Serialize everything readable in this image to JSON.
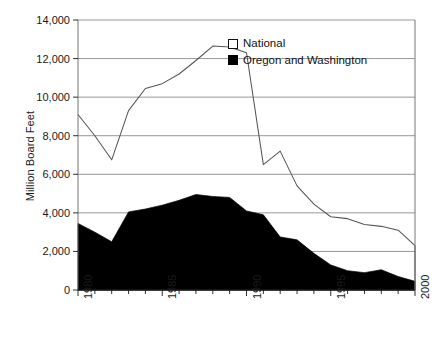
{
  "chart_data": {
    "type": "area",
    "title": "",
    "xlabel": "",
    "ylabel": "Million Board Feet",
    "xlim": [
      1980,
      2000
    ],
    "ylim": [
      0,
      14000
    ],
    "grid": true,
    "legend_position": "top-right-inside",
    "x": [
      1980,
      1981,
      1982,
      1983,
      1984,
      1985,
      1986,
      1987,
      1988,
      1989,
      1990,
      1991,
      1992,
      1993,
      1994,
      1995,
      1996,
      1997,
      1998,
      1999,
      2000
    ],
    "xtick_labels": [
      "1980",
      "1985",
      "1990",
      "1995",
      "2000"
    ],
    "xtick_values": [
      1980,
      1985,
      1990,
      1995,
      2000
    ],
    "ytick_labels": [
      "0",
      "2,000",
      "4,000",
      "6,000",
      "8,000",
      "10,000",
      "12,000",
      "14,000"
    ],
    "ytick_values": [
      0,
      2000,
      4000,
      6000,
      8000,
      10000,
      12000,
      14000
    ],
    "series": [
      {
        "name": "National",
        "style": "line",
        "color": "#555555",
        "fill": "none",
        "values": [
          9100,
          8000,
          6750,
          9300,
          10450,
          10700,
          11200,
          11900,
          12650,
          12600,
          12300,
          6500,
          7200,
          5400,
          4450,
          3800,
          3700,
          3400,
          3300,
          3100,
          2300
        ]
      },
      {
        "name": "Oregon and Washington",
        "style": "filled-area",
        "color": "#000000",
        "fill": "#000000",
        "values": [
          3450,
          3000,
          2500,
          4050,
          4200,
          4400,
          4650,
          4950,
          4850,
          4800,
          4100,
          3900,
          2750,
          2600,
          1900,
          1300,
          1000,
          900,
          1050,
          700,
          450
        ]
      }
    ]
  },
  "legend": {
    "items": [
      {
        "label": "National",
        "swatch": "open-square"
      },
      {
        "label": "Oregon and Washington",
        "swatch": "filled-square"
      }
    ]
  },
  "axes": {
    "y_title": "Million Board Feet"
  },
  "colors": {
    "national_line": "#555555",
    "oregon_washington_fill": "#000000",
    "gridline": "#8c8c8c",
    "axis": "#666666",
    "text": "#1a1a1a",
    "background": "#ffffff"
  }
}
